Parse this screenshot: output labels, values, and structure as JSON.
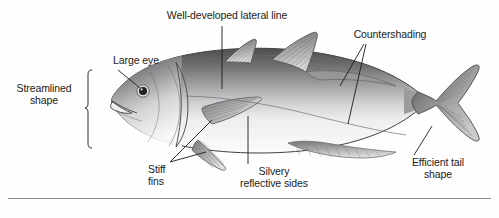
{
  "figure": {
    "background_color": "#fefefe",
    "rule_color": "#8a8a8a",
    "ink_color": "#1b1b1b"
  },
  "labels": {
    "lateral_line": "Well-developed lateral line",
    "large_eye": "Large eye",
    "countershading": "Countershading",
    "streamlined_shape": "Streamlined\nshape",
    "stiff_fins": "Stiff\nfins",
    "silvery_sides": "Silvery\nreflective sides",
    "efficient_tail": "Efficient tail\nshape"
  },
  "parts": {
    "eye": "fish-eye",
    "mouth": "fish-mouth",
    "operculum": "gill-cover",
    "first_dorsal_fin": "first-dorsal-fin",
    "second_dorsal_fin": "second-dorsal-fin",
    "pectoral_fin": "pectoral-fin",
    "pelvic_fin": "pelvic-fin",
    "anal_fin": "anal-fin",
    "caudal_fin": "caudal-fin",
    "lateral_line": "lateral-line",
    "body": "fish-body"
  },
  "colors": {
    "dorsal_dark": "#58595b",
    "mid_gray": "#9a9b9d",
    "belly_light": "#f4f4f4",
    "fin_gray": "#8e8f91",
    "outline": "#3a3a3a"
  }
}
